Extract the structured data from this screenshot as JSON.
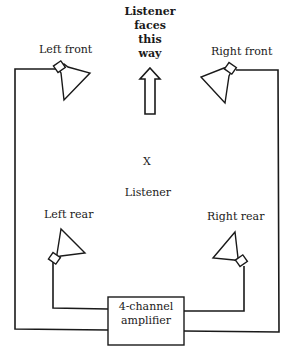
{
  "diagram": {
    "facing_label": [
      "Listener",
      "faces",
      "this",
      "way"
    ],
    "speakers": {
      "left_front": "Left front",
      "right_front": "Right front",
      "left_rear": "Left rear",
      "right_rear": "Right rear"
    },
    "listener_marker": "X",
    "listener_label": "Listener",
    "amplifier": [
      "4-channel",
      "amplifier"
    ]
  }
}
